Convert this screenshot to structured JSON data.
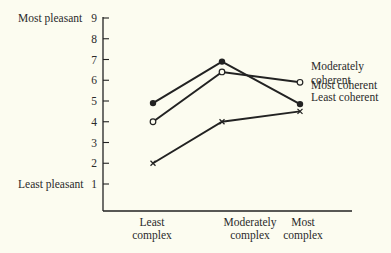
{
  "chart_data": {
    "type": "line",
    "title": "",
    "xlabel": "",
    "ylabel": "",
    "categories": [
      "Least complex",
      "Moderately complex",
      "Most complex"
    ],
    "category_lines": [
      [
        "Least",
        "complex"
      ],
      [
        "Moderately",
        "complex"
      ],
      [
        "Most",
        "complex"
      ]
    ],
    "y_ticks": [
      1,
      2,
      3,
      4,
      5,
      6,
      7,
      8,
      9
    ],
    "ylim": [
      0,
      9
    ],
    "y_annotations": [
      {
        "value": 9,
        "label": "Most pleasant"
      },
      {
        "value": 1,
        "label": "Least pleasant"
      }
    ],
    "grid": false,
    "legend_position": "inline-right",
    "series": [
      {
        "name": "Moderately coherent",
        "label_lines": [
          "Moderately",
          "coherent"
        ],
        "marker": "open-circle",
        "values": [
          4.0,
          6.4,
          5.9
        ]
      },
      {
        "name": "Most coherent",
        "label_lines": [
          "Most coherent"
        ],
        "marker": "filled-circle",
        "values": [
          4.9,
          6.9,
          4.85
        ]
      },
      {
        "name": "Least coherent",
        "label_lines": [
          "Least coherent"
        ],
        "marker": "x",
        "values": [
          2.0,
          4.0,
          4.5
        ]
      }
    ],
    "colors": {
      "line": "#222222",
      "background": "#fcfcf0"
    }
  }
}
